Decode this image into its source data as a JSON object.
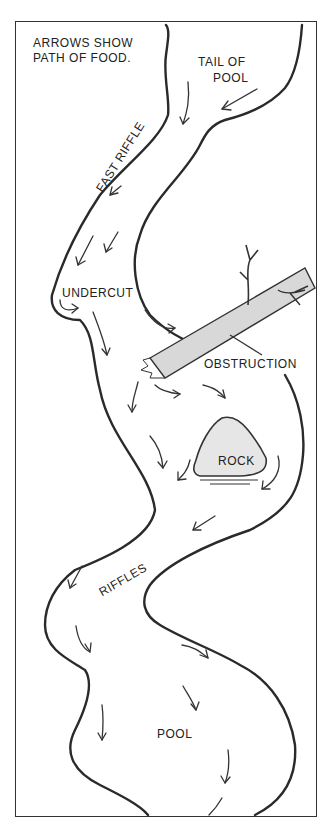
{
  "diagram": {
    "title_note": [
      "ARROWS SHOW",
      "PATH OF FOOD."
    ],
    "labels": {
      "tail_of_pool": [
        "TAIL OF",
        "POOL"
      ],
      "fast_riffle": "FAST RIFFLE",
      "undercut": "UNDERCUT",
      "obstruction": "OBSTRUCTION",
      "rock": "ROCK",
      "riffles": "RIFFLES",
      "pool": "POOL"
    },
    "elements": [
      "stream-banks",
      "fallen-log-obstruction",
      "rock",
      "flow-arrows"
    ],
    "colors": {
      "ink": "#2a2a2a",
      "background": "#ffffff",
      "log_fill": "#d8d8d8",
      "rock_fill": "#e6e6e6"
    }
  }
}
